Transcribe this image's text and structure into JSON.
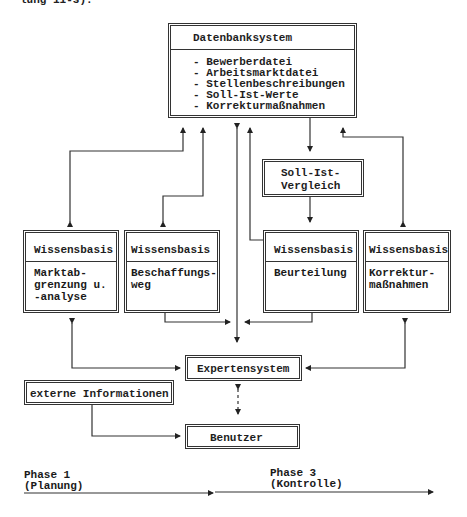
{
  "header_fragment": "lung 11-3).",
  "database": {
    "title": "Datenbanksystem",
    "items": [
      "- Bewerberdatei",
      "- Arbeitsmarktdatei",
      "- Stellenbeschreibungen",
      "- Soll-Ist-Werte",
      "- Korrekturmaßnahmen"
    ]
  },
  "comparison": {
    "line1": "Soll-Ist-",
    "line2": "Vergleich"
  },
  "knowledge_bases": [
    {
      "title": "Wissensbasis",
      "lines": [
        "Marktab-",
        "grenzung u.",
        "-analyse"
      ]
    },
    {
      "title": "Wissensbasis",
      "lines": [
        "Beschaffungs-",
        "weg"
      ]
    },
    {
      "title": "Wissensbasis",
      "lines": [
        "Beurteilung"
      ]
    },
    {
      "title": "Wissensbasis",
      "lines": [
        "Korrektur-",
        "maßnahmen"
      ]
    }
  ],
  "expert_system": {
    "label": "Expertensystem"
  },
  "external_info": {
    "label": "externe Informationen"
  },
  "user": {
    "label": "Benutzer"
  },
  "timeline": {
    "phase1": {
      "name": "Phase 1",
      "desc": "(Planung)"
    },
    "phase3": {
      "name": "Phase 3",
      "desc": "(Kontrolle)"
    }
  },
  "colors": {
    "line": "#333333",
    "text": "#1e1e1e",
    "background": "#ffffff"
  }
}
